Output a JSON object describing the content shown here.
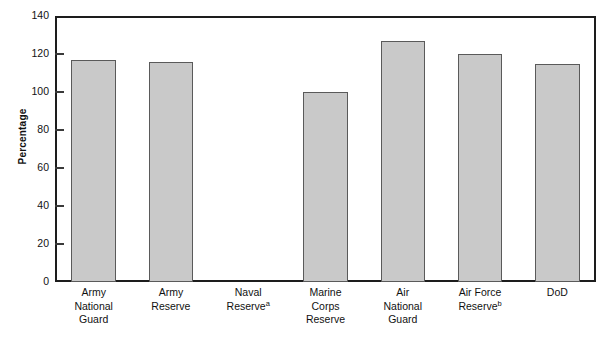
{
  "chart_data": {
    "type": "bar",
    "title": "",
    "xlabel": "",
    "ylabel": "Percentage",
    "ylim": [
      0,
      140
    ],
    "ytick_step": 20,
    "yticks": [
      0,
      20,
      40,
      60,
      80,
      100,
      120,
      140
    ],
    "grid": false,
    "legend": null,
    "bar_color": "#c9c9c9",
    "bar_edge_color": "#5a5a5a",
    "categories": [
      "Army National Guard",
      "Army Reserve",
      "Naval Reserve",
      "Marine Corps Reserve",
      "Air National Guard",
      "Air Force Reserve",
      "DoD"
    ],
    "category_label_lines": [
      [
        "Army",
        "National",
        "Guard"
      ],
      [
        "Army",
        "Reserve"
      ],
      [
        "Naval",
        "Reserve"
      ],
      [
        "Marine",
        "Corps",
        "Reserve"
      ],
      [
        "Air",
        "National",
        "Guard"
      ],
      [
        "Air Force",
        "Reserve"
      ],
      [
        "DoD"
      ]
    ],
    "category_footnotes": [
      "",
      "",
      "a",
      "",
      "",
      "b",
      ""
    ],
    "values": [
      117,
      116,
      null,
      100,
      127,
      120,
      115
    ],
    "missing_note": "Naval Reserve has no bar shown"
  },
  "axis": {
    "y_title": "Percentage",
    "y_tick_labels": [
      "140",
      "120",
      "100",
      "80",
      "60",
      "40",
      "20",
      "0"
    ]
  }
}
